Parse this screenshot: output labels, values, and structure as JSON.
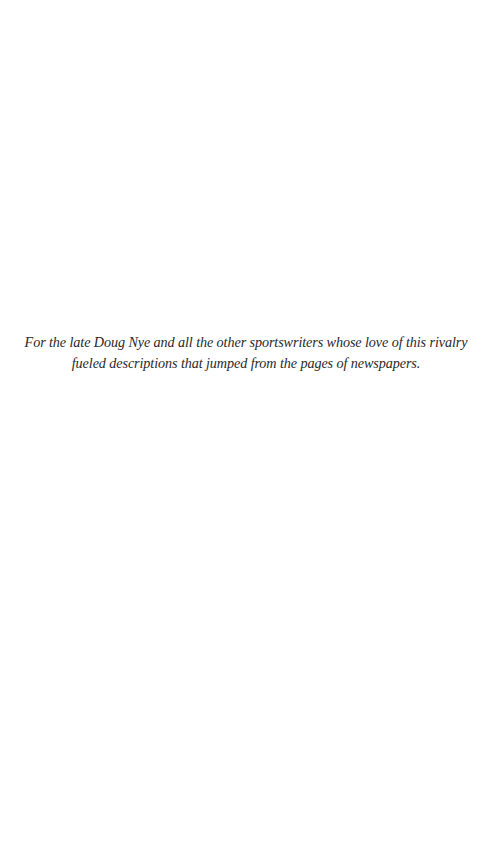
{
  "page": {
    "dedication": {
      "lines": [
        "For the late Doug Nye and all the other sportswriters whose love of  this rivalry",
        "fueled descriptions that jumped from the pages of  newspapers."
      ]
    }
  }
}
